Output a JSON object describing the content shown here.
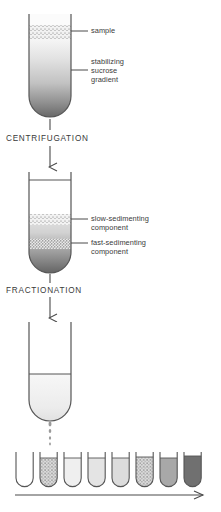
{
  "figure": {
    "background": "#ffffff",
    "ink": "#4a4a4a",
    "text_color": "#3a3a3a"
  },
  "steps": [
    {
      "id": "centrifugation",
      "label": "CENTRIFUGATION"
    },
    {
      "id": "fractionation",
      "label": "FRACTIONATION"
    }
  ],
  "annotations": [
    {
      "id": "sample",
      "label": "sample",
      "lines": [
        "sample"
      ]
    },
    {
      "id": "stabilizing-sucrose-gradient",
      "label": "stabilizing sucrose gradient",
      "lines": [
        "stabilizing",
        "sucrose",
        "gradient"
      ]
    },
    {
      "id": "slow-sedimenting-component",
      "label": "slow-sedimenting component",
      "lines": [
        "slow-sedimenting",
        "component"
      ]
    },
    {
      "id": "fast-sedimenting-component",
      "label": "fast-sedimenting component",
      "lines": [
        "fast-sedimenting",
        "component"
      ]
    }
  ],
  "tubes": {
    "tube1": {
      "id": "tube-before-centrifugation",
      "caption": "sample layered on top of sucrose gradient",
      "bands": [
        {
          "id": "sample-band",
          "fill": "stipple",
          "density": "medium"
        },
        {
          "id": "gradient-body",
          "fill": "gradient",
          "from": "#f4f4f4",
          "to": "#6f6f6f"
        }
      ]
    },
    "tube2": {
      "id": "tube-after-centrifugation",
      "caption": "components separated into two bands",
      "bands": [
        {
          "id": "slow-band",
          "fill": "stipple",
          "density": "medium"
        },
        {
          "id": "fast-band",
          "fill": "stipple",
          "density": "dense"
        },
        {
          "id": "gradient-body",
          "fill": "gradient",
          "from": "#fbfbfb",
          "to": "#6f6f6f"
        }
      ]
    },
    "tube3": {
      "id": "tube-during-fractionation",
      "caption": "tube pierced, contents dripping out",
      "bands": [
        {
          "id": "remaining-liquid",
          "fill": "solid",
          "color": "#ededed"
        }
      ]
    }
  },
  "fractions": {
    "id": "collection-tubes",
    "count": 8,
    "direction_arrow_label": "fraction number",
    "items": [
      {
        "n": 1,
        "fill": "empty",
        "color": "#ffffff",
        "stipple": false
      },
      {
        "n": 2,
        "fill": "stipple",
        "color": "#d8d8d8",
        "stipple": true
      },
      {
        "n": 3,
        "fill": "solid",
        "color": "#efefef",
        "stipple": false
      },
      {
        "n": 4,
        "fill": "solid",
        "color": "#e4e4e4",
        "stipple": false
      },
      {
        "n": 5,
        "fill": "solid",
        "color": "#dcdcdc",
        "stipple": false
      },
      {
        "n": 6,
        "fill": "stipple",
        "color": "#cfcfcf",
        "stipple": true
      },
      {
        "n": 7,
        "fill": "solid",
        "color": "#a8a8a8",
        "stipple": false
      },
      {
        "n": 8,
        "fill": "solid",
        "color": "#707070",
        "stipple": false
      }
    ]
  }
}
